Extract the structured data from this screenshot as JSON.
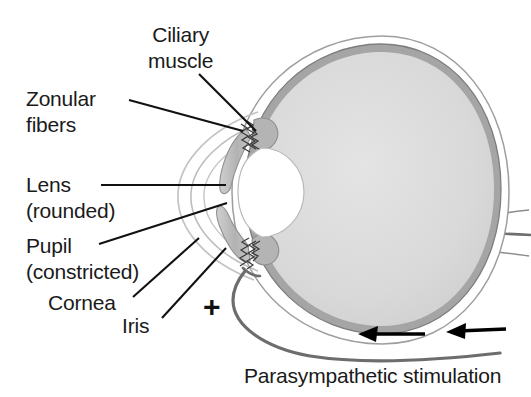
{
  "figure": {
    "background_color": "#ffffff"
  },
  "labels": {
    "ciliary_muscle": {
      "line1": "Ciliary",
      "line2": "muscle"
    },
    "zonular_fibers": {
      "line1": "Zonular",
      "line2": "fibers"
    },
    "lens": {
      "line1": "Lens",
      "line2": "(rounded)"
    },
    "pupil": {
      "line1": "Pupil",
      "line2": "(constricted)"
    },
    "cornea": {
      "line1": "Cornea"
    },
    "iris": {
      "line1": "Iris"
    },
    "parasympathetic": {
      "line1": "Parasympathetic stimulation"
    },
    "plus_sign": "+"
  },
  "colors": {
    "text": "#1a1a1a",
    "leader_line": "#111111",
    "sclera_outline": "#8a8a8a",
    "choroid": "#9a9a9a",
    "vitreous": "#d8d8d8",
    "iris_fill": "#b8b8b8",
    "lens_fill": "#ffffff",
    "nerve": "#555555",
    "arrow": "#000000"
  },
  "structures": [
    {
      "name": "sclera",
      "description": "outer thin white band around eyeball"
    },
    {
      "name": "choroid-retina",
      "description": "gray ring inside sclera"
    },
    {
      "name": "vitreous-body",
      "description": "light gray interior of eyeball"
    },
    {
      "name": "lens",
      "description": "white rounded oval at front of eye"
    },
    {
      "name": "iris",
      "description": "gray tapered flaps above and below lens"
    },
    {
      "name": "ciliary-muscle",
      "description": "thickened gray region at lens equator"
    },
    {
      "name": "zonular-fibers",
      "description": "squiggly suspensory fibers between ciliary body and lens"
    },
    {
      "name": "cornea",
      "description": "thin arcs at front of eye"
    },
    {
      "name": "optic-nerve",
      "description": "stub at right rear of eyeball"
    },
    {
      "name": "parasympathetic-nerve",
      "description": "gray curve running from iris along bottom to right"
    }
  ],
  "arrows": [
    {
      "name": "flow-arrow-left",
      "direction": "left"
    },
    {
      "name": "flow-arrow-right",
      "direction": "left"
    }
  ]
}
